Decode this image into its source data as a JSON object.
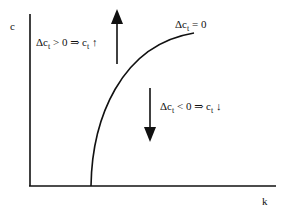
{
  "axes": {
    "y_label": "c",
    "x_label": "k"
  },
  "curve": {
    "label_prefix": "Δc",
    "label_sub": "t",
    "label_suffix": " = 0"
  },
  "region_above": {
    "prefix": "Δc",
    "sub1": "t",
    "mid": " > 0 ⇒ c",
    "sub2": "t",
    "arrow": " ↑",
    "direction": "up"
  },
  "region_below": {
    "prefix": "Δc",
    "sub1": "t",
    "mid": " < 0 ⇒ c",
    "sub2": "t",
    "arrow": " ↓",
    "direction": "down"
  },
  "colors": {
    "ink": "#111111",
    "background": "#ffffff"
  }
}
